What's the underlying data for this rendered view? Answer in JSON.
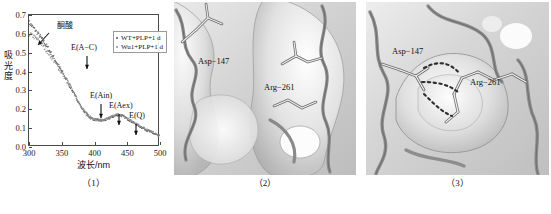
{
  "figure": {
    "panels": [
      {
        "caption": "（1）"
      },
      {
        "caption": "（2）"
      },
      {
        "caption": "（3）"
      }
    ]
  },
  "panel1": {
    "xlabel": "波长/nm",
    "ylabel": "吸光度",
    "caption": "（1）",
    "legend": [
      {
        "label": "WT+PLP+1 d",
        "color": "#555555",
        "marker": "dot"
      },
      {
        "label": "Wu1+PLP+1 d",
        "color": "#8c8c8c",
        "marker": "dot"
      }
    ],
    "yticks": [
      "0.0",
      "0.1",
      "0.2",
      "0.3",
      "0.4",
      "0.5",
      "0.6",
      "0.7"
    ],
    "xticks": [
      "300",
      "350",
      "400",
      "450",
      "500"
    ],
    "annotations": [
      {
        "text": "酮酸",
        "x": 318,
        "y": 0.655
      },
      {
        "text": "E(A−C)",
        "x": 352,
        "y": 0.465
      },
      {
        "text": "E(Ain)",
        "x": 408,
        "y": 0.215
      },
      {
        "text": "E(Aex)",
        "x": 437,
        "y": 0.205
      },
      {
        "text": "E(Q)",
        "x": 464,
        "y": 0.155
      }
    ]
  },
  "chart_data": {
    "type": "scatter",
    "title": "",
    "xlabel": "波长/nm",
    "ylabel": "吸光度",
    "xlim": [
      300,
      500
    ],
    "ylim": [
      0.0,
      0.7
    ],
    "grid": false,
    "legend_position": "top-right",
    "xticks": [
      300,
      350,
      400,
      450,
      500
    ],
    "yticks": [
      0.0,
      0.1,
      0.2,
      0.3,
      0.4,
      0.5,
      0.6,
      0.7
    ],
    "annotations": [
      {
        "label": "酮酸",
        "x": 318,
        "y": 0.62,
        "note": "keto acid shoulder near 315 nm"
      },
      {
        "label": "E(A−C)",
        "x": 352,
        "y": 0.44
      },
      {
        "label": "E(Ain)",
        "x": 410,
        "y": 0.135
      },
      {
        "label": "E(Aex)",
        "x": 437,
        "y": 0.165
      },
      {
        "label": "E(Q)",
        "x": 464,
        "y": 0.12
      }
    ],
    "series": [
      {
        "name": "WT+PLP+1 d",
        "color": "#555555",
        "x": [
          300,
          305,
          310,
          315,
          320,
          325,
          330,
          335,
          340,
          345,
          350,
          355,
          360,
          365,
          370,
          375,
          380,
          385,
          390,
          395,
          400,
          405,
          410,
          415,
          420,
          425,
          430,
          435,
          440,
          445,
          450,
          455,
          460,
          465,
          470,
          475,
          480,
          485,
          490,
          495,
          500
        ],
        "y": [
          0.662,
          0.64,
          0.618,
          0.596,
          0.572,
          0.546,
          0.519,
          0.491,
          0.462,
          0.432,
          0.402,
          0.371,
          0.34,
          0.308,
          0.275,
          0.242,
          0.21,
          0.184,
          0.164,
          0.152,
          0.146,
          0.142,
          0.14,
          0.142,
          0.148,
          0.156,
          0.164,
          0.17,
          0.168,
          0.16,
          0.15,
          0.139,
          0.128,
          0.118,
          0.108,
          0.099,
          0.09,
          0.081,
          0.072,
          0.063,
          0.055
        ]
      },
      {
        "name": "Wu1+PLP+1 d",
        "color": "#8c8c8c",
        "x": [
          300,
          305,
          310,
          315,
          320,
          325,
          330,
          335,
          340,
          345,
          350,
          355,
          360,
          365,
          370,
          375,
          380,
          385,
          390,
          395,
          400,
          405,
          410,
          415,
          420,
          425,
          430,
          435,
          440,
          445,
          450,
          455,
          460,
          465,
          470,
          475,
          480,
          485,
          490,
          495,
          500
        ],
        "y": [
          0.6,
          0.592,
          0.578,
          0.562,
          0.543,
          0.521,
          0.498,
          0.474,
          0.448,
          0.421,
          0.394,
          0.366,
          0.337,
          0.307,
          0.277,
          0.246,
          0.216,
          0.191,
          0.171,
          0.158,
          0.15,
          0.145,
          0.143,
          0.145,
          0.151,
          0.159,
          0.167,
          0.173,
          0.171,
          0.163,
          0.153,
          0.142,
          0.131,
          0.121,
          0.111,
          0.102,
          0.093,
          0.084,
          0.075,
          0.066,
          0.058
        ]
      }
    ]
  },
  "panel2": {
    "caption": "（2）",
    "labels": [
      {
        "text": "Asp−147",
        "x": 24,
        "y": 62
      },
      {
        "text": "Arg−261",
        "x": 90,
        "y": 88
      }
    ],
    "description": "molecular-surface-open-pocket"
  },
  "panel3": {
    "caption": "（3）",
    "labels": [
      {
        "text": "Asp−147",
        "x": 26,
        "y": 52
      },
      {
        "text": "Arg−261",
        "x": 104,
        "y": 83
      }
    ],
    "description": "molecular-surface-salt-bridge-hbonds"
  }
}
